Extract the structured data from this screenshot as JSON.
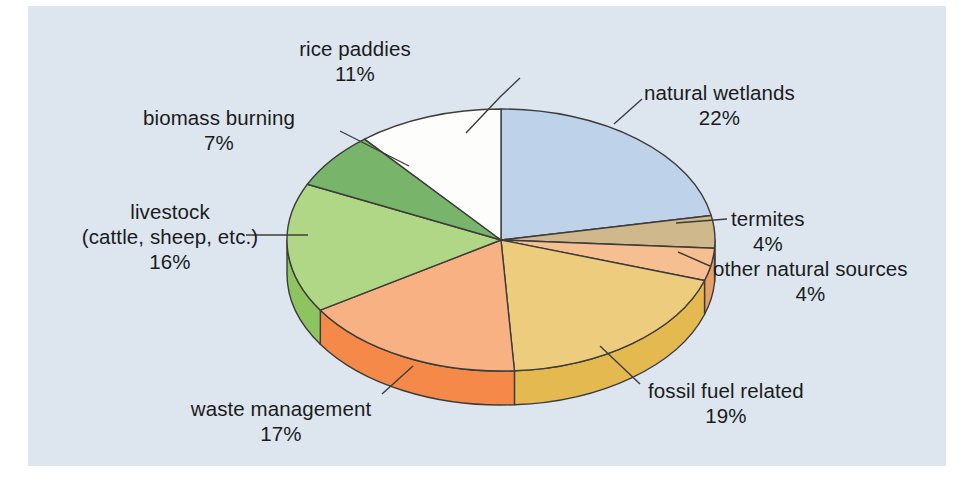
{
  "figure": {
    "background": "#ffffff",
    "plot_background": "#dde6ef",
    "outline_color": "#3c3c3c"
  },
  "chart_data": {
    "type": "pie",
    "title": "",
    "subtitle": "",
    "xlabel": "",
    "ylabel": "",
    "style": "3d-pie",
    "legend_position": "none",
    "grid": false,
    "units": "percent",
    "total": 100,
    "categories": [
      "natural wetlands",
      "termites",
      "other natural sources",
      "fossil fuel related",
      "waste management",
      "livestock (cattle, sheep, etc.)",
      "biomass burning",
      "rice paddies"
    ],
    "values": [
      22,
      4,
      4,
      19,
      17,
      16,
      7,
      11
    ],
    "slices": [
      {
        "id": "natural-wetlands",
        "label": "natural wetlands",
        "label_line1": "natural wetlands",
        "label_line2": "",
        "value": 22,
        "value_text": "22%",
        "color": "#bed3ea",
        "side_color": "#9bb8d8",
        "start_deg": 0,
        "end_deg": 79.2
      },
      {
        "id": "termites",
        "label": "termites",
        "label_line1": "termites",
        "label_line2": "",
        "value": 4,
        "value_text": "4%",
        "color": "#cfb88c",
        "side_color": "#b39c6f",
        "start_deg": 79.2,
        "end_deg": 93.6
      },
      {
        "id": "other-natural-sources",
        "label": "other natural sources",
        "label_line1": "other natural sources",
        "label_line2": "",
        "value": 4,
        "value_text": "4%",
        "color": "#f6bf92",
        "side_color": "#e9a068",
        "start_deg": 93.6,
        "end_deg": 108.0
      },
      {
        "id": "fossil-fuel-related",
        "label": "fossil fuel related",
        "label_line1": "fossil fuel related",
        "label_line2": "",
        "value": 19,
        "value_text": "19%",
        "color": "#edcd7d",
        "side_color": "#e3b950",
        "start_deg": 108.0,
        "end_deg": 176.4
      },
      {
        "id": "waste-management",
        "label": "waste management",
        "label_line1": "waste management",
        "label_line2": "",
        "value": 17,
        "value_text": "17%",
        "color": "#f8b183",
        "side_color": "#f5894a",
        "start_deg": 176.4,
        "end_deg": 237.6
      },
      {
        "id": "livestock",
        "label": "livestock (cattle, sheep, etc.)",
        "label_line1": "livestock",
        "label_line2": "(cattle, sheep, etc.)",
        "value": 16,
        "value_text": "16%",
        "color": "#b0d786",
        "side_color": "#8ec45f",
        "start_deg": 237.6,
        "end_deg": 295.2
      },
      {
        "id": "biomass-burning",
        "label": "biomass burning",
        "label_line1": "biomass burning",
        "label_line2": "",
        "value": 7,
        "value_text": "7%",
        "color": "#79b46b",
        "side_color": "#5f9a53",
        "start_deg": 295.2,
        "end_deg": 320.4
      },
      {
        "id": "rice-paddies",
        "label": "rice paddies",
        "label_line1": "rice paddies",
        "label_line2": "",
        "value": 11,
        "value_text": "11%",
        "color": "#fdfdfc",
        "side_color": "#e2e2de",
        "start_deg": 320.4,
        "end_deg": 360.0
      }
    ]
  },
  "labels": {
    "rice_paddies": {
      "name": "rice paddies",
      "value": "11%"
    },
    "biomass_burning": {
      "name": "biomass burning",
      "value": "7%"
    },
    "livestock_l1": "livestock",
    "livestock_l2": "(cattle, sheep, etc.)",
    "livestock_value": "16%",
    "waste_management": {
      "name": "waste management",
      "value": "17%"
    },
    "natural_wetlands": {
      "name": "natural wetlands",
      "value": "22%"
    },
    "termites": {
      "name": "termites",
      "value": "4%"
    },
    "other_natural_sources": {
      "name": "other natural sources",
      "value": "4%"
    },
    "fossil_fuel_related": {
      "name": "fossil fuel related",
      "value": "19%"
    }
  }
}
